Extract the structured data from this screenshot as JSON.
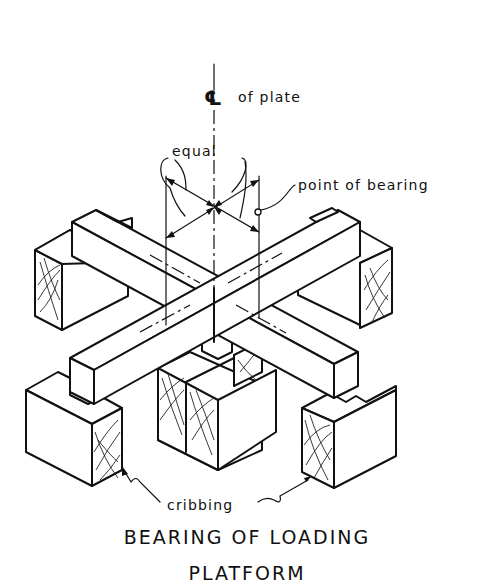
{
  "diagram": {
    "title_line1": "BEARING OF LOADING",
    "title_line2": "PLATFORM",
    "labels": {
      "centerline_symbol": "℄",
      "centerline_text": "of plate",
      "equal": "equal",
      "point_of_bearing": "point of bearing",
      "cribbing": "cribbing"
    },
    "colors": {
      "line": "#111111",
      "background": "#ffffff"
    },
    "components": [
      "two crossing timber beams",
      "four cribbing blocks (left, right, front-left, front-right)",
      "central stacked cribbing under crossing",
      "centerline of plate",
      "equal-distance dimension arrows",
      "point of bearing marker"
    ]
  }
}
